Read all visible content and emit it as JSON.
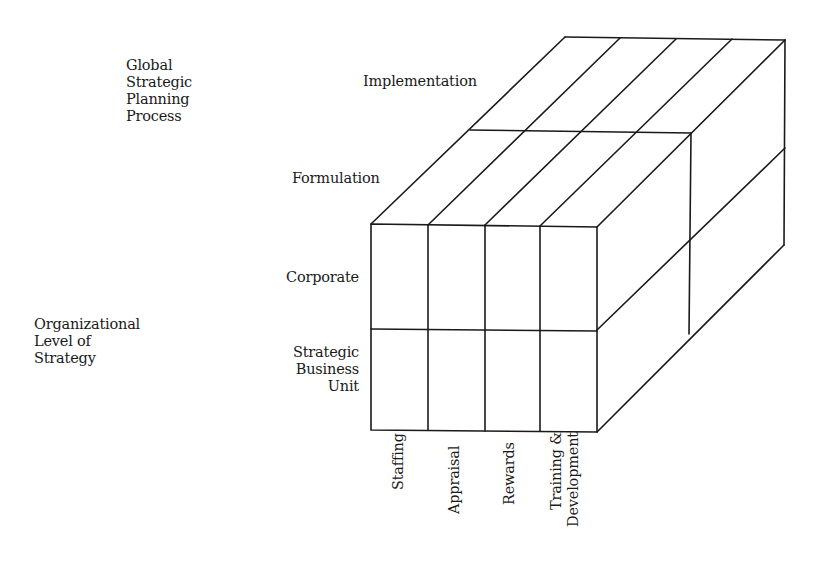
{
  "axes": {
    "process_axis": {
      "title_lines": [
        "Global",
        "Strategic",
        "Planning",
        "Process"
      ],
      "levels": [
        "Implementation",
        "Formulation"
      ]
    },
    "organizational_axis": {
      "title_lines": [
        "Organizational",
        "Level of",
        "Strategy"
      ],
      "levels": [
        {
          "lines": [
            "Corporate"
          ]
        },
        {
          "lines": [
            "Strategic",
            "Business",
            "Unit"
          ]
        }
      ]
    },
    "hr_functions": {
      "items": [
        {
          "lines": [
            "Staffing"
          ]
        },
        {
          "lines": [
            "Appraisal"
          ]
        },
        {
          "lines": [
            "Rewards"
          ]
        },
        {
          "lines": [
            "Training &",
            "Development"
          ]
        }
      ]
    }
  },
  "style": {
    "line_color": "#1a1a1a",
    "background": "#ffffff"
  }
}
